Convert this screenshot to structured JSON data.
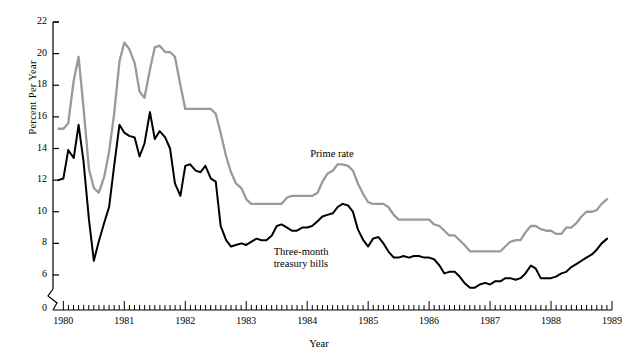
{
  "chart_data": {
    "type": "line",
    "title": "",
    "xlabel": "Year",
    "ylabel": "Percent Per Year",
    "xlim": [
      1979.83,
      1989.0
    ],
    "ylim": [
      5.0,
      22.0
    ],
    "yticks": [
      6,
      8,
      10,
      12,
      14,
      16,
      18,
      20,
      22
    ],
    "ytick_labels": [
      "6",
      "8",
      "10",
      "12",
      "14",
      "16",
      "18",
      "20",
      "22"
    ],
    "y_axis_break_label": "0",
    "xticks": [
      1980,
      1981,
      1982,
      1983,
      1984,
      1985,
      1986,
      1987,
      1988,
      1989
    ],
    "xtick_labels": [
      "1980",
      "1981",
      "1982",
      "1983",
      "1984",
      "1985",
      "1986",
      "1987",
      "1988",
      "1989"
    ],
    "minor_xticks_per_year": 12,
    "grid": false,
    "legend_position": "inline-annotations",
    "series": [
      {
        "name": "Prime rate",
        "color": "#9a9a9a",
        "width": 2.3,
        "annotation": "Prime rate",
        "annotation_xy": [
          1984.05,
          13.6
        ],
        "x": [
          1979.92,
          1980.0,
          1980.08,
          1980.17,
          1980.25,
          1980.33,
          1980.42,
          1980.5,
          1980.58,
          1980.67,
          1980.75,
          1980.83,
          1980.92,
          1981.0,
          1981.08,
          1981.17,
          1981.25,
          1981.33,
          1981.42,
          1981.5,
          1981.58,
          1981.67,
          1981.75,
          1981.83,
          1981.92,
          1982.0,
          1982.08,
          1982.17,
          1982.25,
          1982.33,
          1982.42,
          1982.5,
          1982.58,
          1982.67,
          1982.75,
          1982.83,
          1982.92,
          1983.0,
          1983.08,
          1983.17,
          1983.25,
          1983.33,
          1983.42,
          1983.5,
          1983.58,
          1983.67,
          1983.75,
          1983.83,
          1983.92,
          1984.0,
          1984.08,
          1984.17,
          1984.25,
          1984.33,
          1984.42,
          1984.5,
          1984.58,
          1984.67,
          1984.75,
          1984.83,
          1984.92,
          1985.0,
          1985.08,
          1985.17,
          1985.25,
          1985.33,
          1985.42,
          1985.5,
          1985.58,
          1985.67,
          1985.75,
          1985.83,
          1985.92,
          1986.0,
          1986.08,
          1986.17,
          1986.25,
          1986.33,
          1986.42,
          1986.5,
          1986.58,
          1986.67,
          1986.75,
          1986.83,
          1986.92,
          1987.0,
          1987.08,
          1987.17,
          1987.25,
          1987.33,
          1987.42,
          1987.5,
          1987.58,
          1987.67,
          1987.75,
          1987.83,
          1987.92,
          1988.0,
          1988.08,
          1988.17,
          1988.25,
          1988.33,
          1988.42,
          1988.5,
          1988.58,
          1988.67,
          1988.75,
          1988.83,
          1988.92
        ],
        "y": [
          15.25,
          15.25,
          15.6,
          18.3,
          19.8,
          16.6,
          12.7,
          11.5,
          11.2,
          12.2,
          13.8,
          16.1,
          19.5,
          20.7,
          20.3,
          19.4,
          17.6,
          17.2,
          19.0,
          20.4,
          20.5,
          20.1,
          20.1,
          19.8,
          18.0,
          16.5,
          16.5,
          16.5,
          16.5,
          16.5,
          16.5,
          16.2,
          15.0,
          13.5,
          12.5,
          11.8,
          11.5,
          10.8,
          10.5,
          10.5,
          10.5,
          10.5,
          10.5,
          10.5,
          10.5,
          10.9,
          11.0,
          11.0,
          11.0,
          11.0,
          11.0,
          11.2,
          11.9,
          12.4,
          12.6,
          13.0,
          13.0,
          12.9,
          12.6,
          11.8,
          11.1,
          10.6,
          10.5,
          10.5,
          10.5,
          10.3,
          9.8,
          9.5,
          9.5,
          9.5,
          9.5,
          9.5,
          9.5,
          9.5,
          9.2,
          9.1,
          8.8,
          8.5,
          8.5,
          8.2,
          7.9,
          7.5,
          7.5,
          7.5,
          7.5,
          7.5,
          7.5,
          7.5,
          7.8,
          8.1,
          8.2,
          8.2,
          8.7,
          9.1,
          9.1,
          8.9,
          8.8,
          8.8,
          8.6,
          8.6,
          9.0,
          9.0,
          9.3,
          9.7,
          10.0,
          10.0,
          10.1,
          10.5,
          10.8
        ]
      },
      {
        "name": "Three-month treasury bills",
        "color": "#000000",
        "width": 2.0,
        "annotation": "Three-month\ntreasury bills",
        "annotation_xy": [
          1983.45,
          7.4
        ],
        "x": [
          1979.92,
          1980.0,
          1980.08,
          1980.17,
          1980.25,
          1980.33,
          1980.42,
          1980.5,
          1980.58,
          1980.67,
          1980.75,
          1980.83,
          1980.92,
          1981.0,
          1981.08,
          1981.17,
          1981.25,
          1981.33,
          1981.42,
          1981.5,
          1981.58,
          1981.67,
          1981.75,
          1981.83,
          1981.92,
          1982.0,
          1982.08,
          1982.17,
          1982.25,
          1982.33,
          1982.42,
          1982.5,
          1982.58,
          1982.67,
          1982.75,
          1982.83,
          1982.92,
          1983.0,
          1983.08,
          1983.17,
          1983.25,
          1983.33,
          1983.42,
          1983.5,
          1983.58,
          1983.67,
          1983.75,
          1983.83,
          1983.92,
          1984.0,
          1984.08,
          1984.17,
          1984.25,
          1984.33,
          1984.42,
          1984.5,
          1984.58,
          1984.67,
          1984.75,
          1984.83,
          1984.92,
          1985.0,
          1985.08,
          1985.17,
          1985.25,
          1985.33,
          1985.42,
          1985.5,
          1985.58,
          1985.67,
          1985.75,
          1985.83,
          1985.92,
          1986.0,
          1986.08,
          1986.17,
          1986.25,
          1986.33,
          1986.42,
          1986.5,
          1986.58,
          1986.67,
          1986.75,
          1986.83,
          1986.92,
          1987.0,
          1987.08,
          1987.17,
          1987.25,
          1987.33,
          1987.42,
          1987.5,
          1987.58,
          1987.67,
          1987.75,
          1987.83,
          1987.92,
          1988.0,
          1988.08,
          1988.17,
          1988.25,
          1988.33,
          1988.42,
          1988.5,
          1988.58,
          1988.67,
          1988.75,
          1988.83,
          1988.92
        ],
        "y": [
          12.0,
          12.1,
          13.9,
          13.4,
          15.5,
          13.2,
          9.5,
          6.9,
          8.1,
          9.3,
          10.3,
          12.8,
          15.5,
          15.0,
          14.8,
          14.7,
          13.5,
          14.3,
          16.3,
          14.6,
          15.1,
          14.7,
          14.0,
          11.8,
          11.0,
          12.9,
          13.0,
          12.6,
          12.5,
          12.9,
          12.1,
          11.9,
          9.1,
          8.2,
          7.8,
          7.9,
          8.0,
          7.9,
          8.1,
          8.3,
          8.2,
          8.2,
          8.5,
          9.1,
          9.2,
          9.0,
          8.8,
          8.8,
          9.0,
          9.0,
          9.1,
          9.4,
          9.7,
          9.8,
          9.9,
          10.3,
          10.5,
          10.4,
          10.0,
          8.9,
          8.2,
          7.8,
          8.3,
          8.4,
          8.0,
          7.5,
          7.1,
          7.1,
          7.2,
          7.1,
          7.2,
          7.2,
          7.1,
          7.1,
          7.0,
          6.6,
          6.1,
          6.2,
          6.2,
          5.9,
          5.5,
          5.2,
          5.2,
          5.4,
          5.5,
          5.4,
          5.6,
          5.6,
          5.8,
          5.8,
          5.7,
          5.8,
          6.1,
          6.6,
          6.4,
          5.8,
          5.8,
          5.8,
          5.9,
          6.1,
          6.2,
          6.5,
          6.7,
          6.9,
          7.1,
          7.3,
          7.6,
          8.0,
          8.3
        ]
      }
    ]
  },
  "axes": {
    "y_axis_label": "Percent Per Year",
    "x_axis_label": "Year",
    "zero_label": "0"
  }
}
